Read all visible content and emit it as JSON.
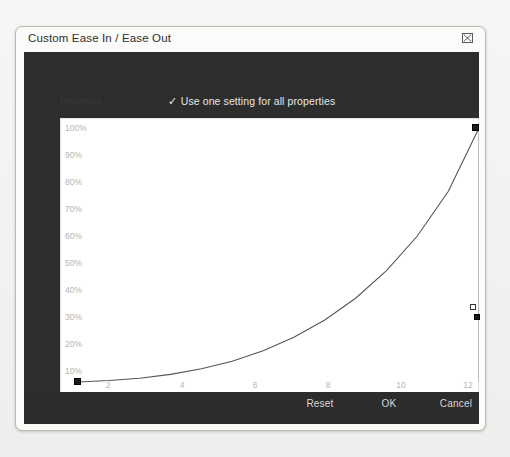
{
  "window": {
    "title": "Custom Ease In / Ease Out",
    "close_icon": "close-icon"
  },
  "panel": {
    "properties_label": "Properties",
    "checkbox": {
      "checked": true,
      "check_glyph": "✓",
      "label": "Use one setting for all properties"
    }
  },
  "chart_data": {
    "type": "line",
    "title": "Custom Ease In / Ease Out",
    "xlabel": "Frames",
    "ylabel": "",
    "grid": false,
    "legend": null,
    "xlim": [
      0,
      13
    ],
    "ylim": [
      0,
      100
    ],
    "x_ticks": [
      "2",
      "4",
      "6",
      "8",
      "10",
      "12"
    ],
    "x_tick_values": [
      2,
      4,
      6,
      8,
      10,
      12
    ],
    "y_ticks": [
      "100%",
      "90%",
      "80%",
      "70%",
      "60%",
      "50%",
      "40%",
      "30%",
      "20%",
      "10%"
    ],
    "y_tick_values": [
      100,
      90,
      80,
      70,
      60,
      50,
      40,
      30,
      20,
      10
    ],
    "series": [
      {
        "name": "Ease curve",
        "x": [
          0,
          1,
          2,
          3,
          4,
          5,
          6,
          7,
          8,
          9,
          10,
          11,
          12,
          13
        ],
        "values": [
          0,
          0.6,
          1.5,
          3.0,
          5.2,
          8.2,
          12.3,
          17.6,
          24.4,
          33.0,
          43.8,
          57.5,
          75.0,
          100
        ]
      }
    ],
    "control_points": [
      {
        "name": "start-anchor",
        "x": 0,
        "y": 0
      },
      {
        "name": "end-anchor",
        "x": 13,
        "y": 100
      },
      {
        "name": "ease-handle",
        "x": 13,
        "y": 28
      }
    ]
  },
  "status": {
    "stop_icon": "stop-icon",
    "play_icon": "play-icon",
    "frames_label": "Frames",
    "frame_readout": "Frame:  13,  100%"
  },
  "footer": {
    "reset_label": "Reset",
    "ok_label": "OK",
    "cancel_label": "Cancel"
  },
  "colors": {
    "panel_bg": "#2c2c2c",
    "dialog_bg": "#fbfbfa",
    "plot_bg": "#ffffff",
    "curve": "#555555",
    "tick_text": "#b4b4b4"
  }
}
